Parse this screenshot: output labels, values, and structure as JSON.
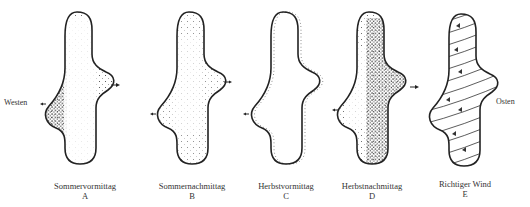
{
  "figure": {
    "side_labels": {
      "west": "Westen",
      "east": "Osten"
    },
    "panels": [
      {
        "id": "A",
        "title": "Sommervormittag",
        "letter": "A",
        "shading": "dense-west"
      },
      {
        "id": "B",
        "title": "Sommernachmittag",
        "letter": "B",
        "shading": "sparse-uniform"
      },
      {
        "id": "C",
        "title": "Herbstvormittag",
        "letter": "C",
        "shading": "edge-west"
      },
      {
        "id": "D",
        "title": "Herbstnachmittag",
        "letter": "D",
        "shading": "dense-east"
      },
      {
        "id": "E",
        "title": "Richtiger Wind",
        "letter": "E",
        "shading": "wind-lines"
      }
    ]
  }
}
